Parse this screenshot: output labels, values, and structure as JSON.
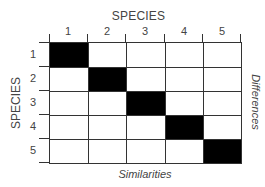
{
  "diagram": {
    "top_title": "SPECIES",
    "left_title": "SPECIES",
    "right_label": "Differences",
    "bottom_label": "Similarities",
    "columns": [
      "1",
      "2",
      "3",
      "4",
      "5"
    ],
    "rows": [
      "1",
      "2",
      "3",
      "4",
      "5"
    ],
    "filled_cells": [
      [
        0,
        0
      ],
      [
        1,
        1
      ],
      [
        2,
        2
      ],
      [
        3,
        3
      ],
      [
        4,
        4
      ]
    ],
    "fill_color": "#000000",
    "line_color": "#333333"
  }
}
